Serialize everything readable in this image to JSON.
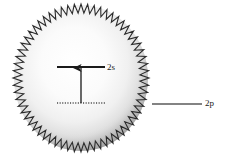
{
  "figure": {
    "title": "",
    "background_color": "#ffffff",
    "sphere": {
      "name": "excited-atom-sphere",
      "center_x": 81,
      "center_y": 78,
      "radius_x": 68,
      "radius_y": 74,
      "fill_center_color": "#ffffff",
      "fill_edge_color": "#b9b9b9",
      "edge_style": "zigzag",
      "zigzag_color": "#2b2b2b",
      "zigzag_teeth": 64,
      "zigzag_amplitude": 9
    },
    "levels": [
      {
        "id": "level-2s",
        "label": "2s",
        "style": "solid",
        "color": "#1a1a1a",
        "x1": 57,
        "x2": 105,
        "y": 67,
        "label_x": 107,
        "label_y": 62
      },
      {
        "id": "level-ground",
        "label": "",
        "style": "dotted",
        "color": "#4a4a4a",
        "x1": 57,
        "x2": 105,
        "y": 103,
        "label_x": 0,
        "label_y": 0
      },
      {
        "id": "level-2p",
        "label": "2p",
        "style": "solid",
        "color": "#5a5a5a",
        "x1": 152,
        "x2": 202,
        "y": 104,
        "label_x": 205,
        "label_y": 98
      }
    ],
    "transition_arrow": {
      "name": "excitation-arrow",
      "color": "#1a1a1a",
      "x": 81,
      "y_tail": 103,
      "y_head": 68,
      "direction": "up",
      "head_width": 8,
      "head_length": 9
    }
  }
}
